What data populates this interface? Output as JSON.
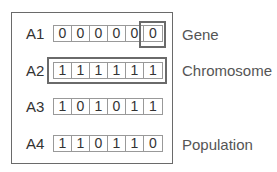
{
  "diagram": {
    "title": "",
    "rows": [
      {
        "label": "A1",
        "bits": [
          "0",
          "0",
          "0",
          "0",
          "0",
          "0"
        ]
      },
      {
        "label": "A2",
        "bits": [
          "1",
          "1",
          "1",
          "1",
          "1",
          "1"
        ]
      },
      {
        "label": "A3",
        "bits": [
          "1",
          "0",
          "1",
          "0",
          "1",
          "1"
        ]
      },
      {
        "label": "A4",
        "bits": [
          "1",
          "1",
          "0",
          "1",
          "1",
          "0"
        ]
      }
    ],
    "annotations": {
      "gene": "Gene",
      "chromosome": "Chromosome",
      "population": "Population"
    },
    "colors": {
      "frame": "#6a6a6a",
      "cell_border": "#999999",
      "text": "#333333"
    }
  }
}
